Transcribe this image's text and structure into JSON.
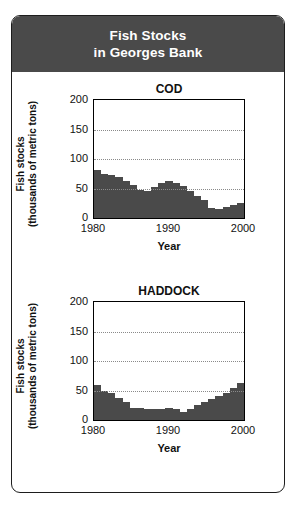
{
  "header": {
    "line1": "Fish Stocks",
    "line2": "in Georges Bank",
    "background": "#4a4a4a",
    "text_color": "#ffffff"
  },
  "axis_label_y_line1": "Fish stocks",
  "axis_label_y_line2": "(thousands of metric tons)",
  "axis_label_x": "Year",
  "bar_color": "#4a4a4a",
  "chart_data": [
    {
      "type": "bar",
      "title": "COD",
      "xlabel": "Year",
      "ylabel": "Fish stocks (thousands of metric tons)",
      "ylim": [
        0,
        200
      ],
      "yticks": [
        0,
        50,
        100,
        150,
        200
      ],
      "xticks": [
        1980,
        1990,
        2000
      ],
      "xlim": [
        1980,
        2000
      ],
      "grid": "horizontal-dotted at 50, 100, 150",
      "legend": "none",
      "x": [
        1980,
        1981,
        1982,
        1983,
        1984,
        1985,
        1986,
        1987,
        1988,
        1989,
        1990,
        1991,
        1992,
        1993,
        1994,
        1995,
        1996,
        1997,
        1998,
        1999,
        2000
      ],
      "values": [
        82,
        74,
        73,
        70,
        62,
        56,
        47,
        46,
        52,
        60,
        62,
        60,
        54,
        46,
        38,
        30,
        17,
        16,
        19,
        22,
        26
      ]
    },
    {
      "type": "bar",
      "title": "HADDOCK",
      "xlabel": "Year",
      "ylabel": "Fish stocks (thousands of metric tons)",
      "ylim": [
        0,
        200
      ],
      "yticks": [
        0,
        50,
        100,
        150,
        200
      ],
      "xticks": [
        1980,
        1990,
        2000
      ],
      "xlim": [
        1980,
        2000
      ],
      "grid": "horizontal-dotted at 50, 100, 150",
      "legend": "none",
      "x": [
        1980,
        1981,
        1982,
        1983,
        1984,
        1985,
        1986,
        1987,
        1988,
        1989,
        1990,
        1991,
        1992,
        1993,
        1994,
        1995,
        1996,
        1997,
        1998,
        1999,
        2000
      ],
      "values": [
        59,
        49,
        45,
        38,
        30,
        21,
        20,
        19,
        19,
        19,
        21,
        18,
        14,
        19,
        25,
        31,
        36,
        40,
        45,
        55,
        63
      ]
    }
  ]
}
